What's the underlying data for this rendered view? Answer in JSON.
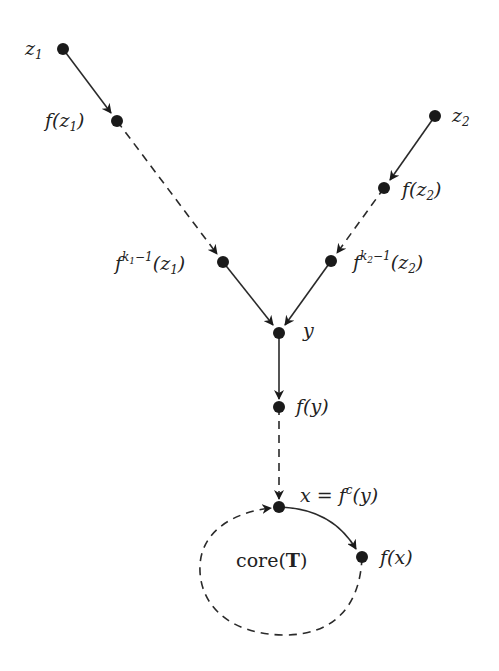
{
  "diagram": {
    "type": "directed-graph",
    "nodes": [
      {
        "id": "z1",
        "label": "z",
        "sub": "1",
        "x": 63,
        "y": 49
      },
      {
        "id": "fz1",
        "label_pre": "f(z",
        "sub": "1",
        "label_post": ")",
        "x": 117,
        "y": 121
      },
      {
        "id": "fk1z1",
        "label_pre": "f",
        "sup": "k₁−1",
        "label_mid": "(z",
        "sub": "1",
        "label_post": ")",
        "x": 223,
        "y": 262
      },
      {
        "id": "z2",
        "label": "z",
        "sub": "2",
        "x": 435,
        "y": 116
      },
      {
        "id": "fz2",
        "label_pre": "f(z",
        "sub": "2",
        "label_post": ")",
        "x": 384,
        "y": 188
      },
      {
        "id": "fk2z2",
        "label_pre": "f",
        "sup": "k₂−1",
        "label_mid": "(z",
        "sub": "2",
        "label_post": ")",
        "x": 331,
        "y": 261
      },
      {
        "id": "y",
        "label": "y",
        "x": 279,
        "y": 333
      },
      {
        "id": "fy",
        "label": "f(y)",
        "x": 279,
        "y": 407
      },
      {
        "id": "x",
        "label_pre": "x = f",
        "sup": "c",
        "label_post": "(y)",
        "x": 279,
        "y": 507
      },
      {
        "id": "fx",
        "label": "f(x)",
        "x": 362,
        "y": 557
      }
    ],
    "edges": [
      {
        "from": "z1",
        "to": "fz1",
        "style": "solid"
      },
      {
        "from": "fz1",
        "to": "fk1z1",
        "style": "dashed"
      },
      {
        "from": "fk1z1",
        "to": "y",
        "style": "solid"
      },
      {
        "from": "z2",
        "to": "fz2",
        "style": "solid"
      },
      {
        "from": "fz2",
        "to": "fk2z2",
        "style": "dashed"
      },
      {
        "from": "fk2z2",
        "to": "y",
        "style": "solid"
      },
      {
        "from": "y",
        "to": "fy",
        "style": "solid"
      },
      {
        "from": "fy",
        "to": "x",
        "style": "dashed"
      },
      {
        "from": "x",
        "to": "fx",
        "style": "solid",
        "curved": true
      },
      {
        "from": "fx",
        "to": "x",
        "style": "dashed",
        "curved": true,
        "loop": true
      }
    ],
    "region_label": {
      "pre": "core(",
      "bold": "T",
      "post": ")"
    },
    "labels": {
      "z1": "z",
      "z1_sub": "1",
      "fz1_pre": "f(z",
      "fz1_sub": "1",
      "fz1_post": ")",
      "fk1_f": "f",
      "fk1_sup": "k",
      "fk1_supsub": "1",
      "fk1_supend": "−1",
      "fk1_mid": "(z",
      "fk1_sub": "1",
      "fk1_post": ")",
      "z2": "z",
      "z2_sub": "2",
      "fz2_pre": "f(z",
      "fz2_sub": "2",
      "fz2_post": ")",
      "fk2_f": "f",
      "fk2_sup": "k",
      "fk2_supsub": "2",
      "fk2_supend": "−1",
      "fk2_mid": "(z",
      "fk2_sub": "2",
      "fk2_post": ")",
      "y": "y",
      "fy": "f(y)",
      "x_pre": "x = f",
      "x_sup": "c",
      "x_post": "(y)",
      "fx": "f(x)",
      "core_pre": "core(",
      "core_bold": "T",
      "core_post": ")"
    }
  }
}
